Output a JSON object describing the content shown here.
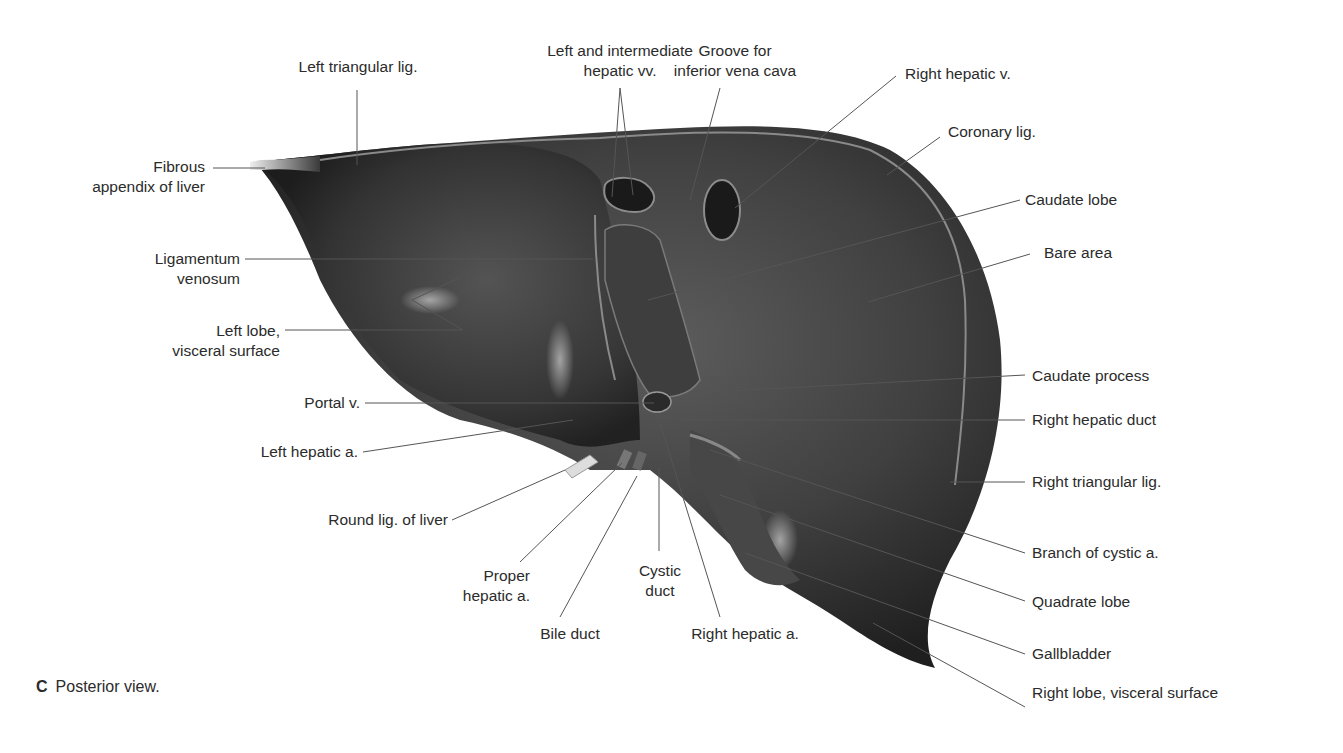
{
  "figure": {
    "caption_letter": "C",
    "caption_text": "Posterior view.",
    "subject": "Liver"
  },
  "labels": {
    "left_triangular_lig": "Left triangular lig.",
    "left_intermediate_hv_1": "Left and intermediate",
    "left_intermediate_hv_2": "hepatic vv.",
    "groove_ivc_1": "Groove for",
    "groove_ivc_2": "inferior vena cava",
    "right_hepatic_v": "Right hepatic v.",
    "coronary_lig": "Coronary lig.",
    "fibrous_appendix_1": "Fibrous",
    "fibrous_appendix_2": "appendix of liver",
    "caudate_lobe": "Caudate lobe",
    "bare_area": "Bare area",
    "ligamentum_venosum_1": "Ligamentum",
    "ligamentum_venosum_2": "venosum",
    "left_lobe_1": "Left lobe,",
    "left_lobe_2": "visceral surface",
    "caudate_process": "Caudate process",
    "portal_v": "Portal v.",
    "right_hepatic_duct": "Right hepatic duct",
    "left_hepatic_a": "Left hepatic a.",
    "right_triangular_lig": "Right triangular lig.",
    "round_lig": "Round lig. of liver",
    "branch_cystic_a": "Branch of cystic a.",
    "proper_hepatic_a_1": "Proper",
    "proper_hepatic_a_2": "hepatic a.",
    "cystic_duct_1": "Cystic",
    "cystic_duct_2": "duct",
    "quadrate_lobe": "Quadrate lobe",
    "bile_duct": "Bile duct",
    "right_hepatic_a": "Right hepatic a.",
    "gallbladder": "Gallbladder",
    "right_lobe_visceral": "Right lobe, visceral surface"
  },
  "colors": {
    "liver_dark": "#2e2e2e",
    "liver_mid": "#4a4a4a",
    "liver_light": "#6e6e6e",
    "leader_line": "#555555",
    "text": "#2b2b2b"
  }
}
